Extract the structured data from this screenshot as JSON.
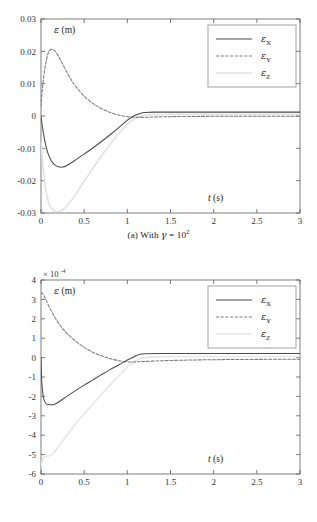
{
  "figure": {
    "panels": [
      {
        "id": "a",
        "caption_prefix": "(a) With ",
        "caption_symbol": "γ",
        "caption_equals": " = 10",
        "caption_exponent": "2"
      },
      {
        "id": "b",
        "caption_prefix": "(b) With ",
        "caption_symbol": "γ",
        "caption_equals": " = 10",
        "caption_exponent": "4"
      }
    ]
  },
  "chart_data": [
    {
      "type": "line",
      "title": "",
      "panel_label": "(a) With γ = 10^2",
      "ylabel": "ε (m)",
      "xlabel": "t (s)",
      "exponent_label": "",
      "xlim": [
        0,
        3
      ],
      "ylim": [
        -0.03,
        0.03
      ],
      "xticks": [
        0,
        0.5,
        1,
        1.5,
        2,
        2.5,
        3
      ],
      "xticklabels": [
        "0",
        "0.5",
        "1",
        "1.5",
        "2",
        "2.5",
        "3"
      ],
      "yticks": [
        0.03,
        0.02,
        0.01,
        0,
        -0.01,
        -0.02,
        -0.03
      ],
      "yticklabels": [
        "0.03",
        "0.02",
        "0.01",
        "0",
        "-0.01",
        "-0.02",
        "-0.03"
      ],
      "grid": false,
      "legend_position": "upper right",
      "legend": [
        "ε",
        "ε",
        "ε"
      ],
      "legend_subscripts": [
        "X",
        "Y",
        "Z"
      ],
      "series": [
        {
          "name": "epsilon_X",
          "style": "solid",
          "color": "#4a4a4a",
          "x": [
            0,
            0.02,
            0.05,
            0.08,
            0.12,
            0.16,
            0.2,
            0.25,
            0.3,
            0.35,
            0.4,
            0.5,
            0.6,
            0.7,
            0.8,
            0.9,
            1.0,
            1.05,
            1.1,
            1.15,
            1.2,
            1.3,
            1.5,
            2.0,
            2.5,
            3.0
          ],
          "y": [
            0,
            -0.004,
            -0.0085,
            -0.0115,
            -0.0139,
            -0.0151,
            -0.0157,
            -0.0158,
            -0.0153,
            -0.0145,
            -0.0136,
            -0.0118,
            -0.0099,
            -0.0079,
            -0.0058,
            -0.0036,
            -0.0013,
            -0.0004,
            0.0003,
            0.0008,
            0.0011,
            0.0012,
            0.0012,
            0.0012,
            0.0012,
            0.0012
          ]
        },
        {
          "name": "epsilon_Y",
          "style": "dashed",
          "color": "#7a7a7a",
          "x": [
            0,
            0.02,
            0.05,
            0.08,
            0.1,
            0.13,
            0.16,
            0.2,
            0.25,
            0.3,
            0.35,
            0.4,
            0.5,
            0.6,
            0.7,
            0.8,
            0.9,
            1.0,
            1.1,
            1.2,
            1.3,
            1.5,
            2.0,
            2.5,
            3.0
          ],
          "y": [
            0.003,
            0.0095,
            0.0155,
            0.0192,
            0.0203,
            0.0206,
            0.0201,
            0.0186,
            0.0161,
            0.0135,
            0.0112,
            0.0092,
            0.0061,
            0.0039,
            0.0023,
            0.0011,
            0.0003,
            -0.0002,
            -0.0004,
            -0.0004,
            -0.0003,
            -0.0002,
            -0.0001,
            -0.0001,
            -0.0001
          ]
        },
        {
          "name": "epsilon_Z",
          "style": "solid-light",
          "color": "#e2e2e2",
          "x": [
            0,
            0.03,
            0.06,
            0.1,
            0.14,
            0.18,
            0.22,
            0.25,
            0.28,
            0.32,
            0.36,
            0.4,
            0.5,
            0.6,
            0.7,
            0.8,
            0.9,
            1.0,
            1.05,
            1.1,
            1.2,
            1.3,
            1.5,
            2.0,
            2.5,
            3.0
          ],
          "y": [
            -0.008,
            -0.0175,
            -0.0235,
            -0.0276,
            -0.0291,
            -0.0296,
            -0.0294,
            -0.029,
            -0.0284,
            -0.0272,
            -0.0258,
            -0.0243,
            -0.0202,
            -0.0162,
            -0.0124,
            -0.0088,
            -0.0055,
            -0.0025,
            -0.0014,
            -0.0006,
            0.0002,
            0.0004,
            0.0005,
            0.0005,
            0.0005,
            0.0005
          ]
        }
      ]
    },
    {
      "type": "line",
      "title": "",
      "panel_label": "(b) With γ = 10^4",
      "ylabel": "ε (m)",
      "xlabel": "t (s)",
      "exponent_label": "× 10⁻⁴",
      "exponent_base": "10",
      "exponent_power": "-4",
      "xlim": [
        0,
        3
      ],
      "ylim": [
        -6,
        4
      ],
      "yscale_factor": 0.0001,
      "xticks": [
        0,
        0.5,
        1,
        1.5,
        2,
        2.5,
        3
      ],
      "xticklabels": [
        "0",
        "0.5",
        "1",
        "1.5",
        "2",
        "2.5",
        "3"
      ],
      "yticks": [
        4,
        3,
        2,
        1,
        0,
        -1,
        -2,
        -3,
        -4,
        -5,
        -6
      ],
      "yticklabels": [
        "4",
        "3",
        "2",
        "1",
        "0",
        "-1",
        "-2",
        "-3",
        "-4",
        "-5",
        "-6"
      ],
      "grid": false,
      "legend_position": "upper right",
      "legend": [
        "ε",
        "ε",
        "ε"
      ],
      "legend_subscripts": [
        "X",
        "Y",
        "Z"
      ],
      "series": [
        {
          "name": "epsilon_X",
          "style": "solid",
          "color": "#4a4a4a",
          "x": [
            0,
            0.01,
            0.03,
            0.06,
            0.09,
            0.12,
            0.15,
            0.2,
            0.3,
            0.4,
            0.5,
            0.6,
            0.7,
            0.8,
            0.9,
            1.0,
            1.05,
            1.1,
            1.15,
            1.2,
            1.4,
            1.8,
            2.2,
            2.6,
            3.0
          ],
          "y": [
            0,
            -1.3,
            -2.1,
            -2.38,
            -2.42,
            -2.43,
            -2.42,
            -2.3,
            -2.0,
            -1.7,
            -1.42,
            -1.15,
            -0.88,
            -0.62,
            -0.38,
            -0.12,
            -0.02,
            0.1,
            0.17,
            0.2,
            0.21,
            0.21,
            0.21,
            0.21,
            0.21
          ]
        },
        {
          "name": "epsilon_Y",
          "style": "dashed",
          "color": "#7a7a7a",
          "x": [
            0,
            0.02,
            0.05,
            0.08,
            0.12,
            0.16,
            0.2,
            0.25,
            0.3,
            0.4,
            0.5,
            0.6,
            0.7,
            0.8,
            0.9,
            1.0,
            1.1,
            1.2,
            1.4,
            1.8,
            2.2,
            2.6,
            3.0
          ],
          "y": [
            3.35,
            3.3,
            3.05,
            2.75,
            2.4,
            2.08,
            1.8,
            1.5,
            1.25,
            0.85,
            0.53,
            0.28,
            0.09,
            -0.05,
            -0.16,
            -0.22,
            -0.22,
            -0.2,
            -0.16,
            -0.12,
            -0.1,
            -0.09,
            -0.08
          ]
        },
        {
          "name": "epsilon_Z",
          "style": "solid-light",
          "color": "#e6e6e6",
          "x": [
            0,
            0.02,
            0.04,
            0.06,
            0.09,
            0.12,
            0.15,
            0.2,
            0.25,
            0.3,
            0.4,
            0.5,
            0.6,
            0.7,
            0.8,
            0.9,
            1.0,
            1.05,
            1.1,
            1.2,
            1.4,
            1.8,
            2.2,
            2.6,
            3.0
          ],
          "y": [
            -5.6,
            -5.25,
            -5.1,
            -5.08,
            -5.07,
            -5.0,
            -4.9,
            -4.6,
            -4.3,
            -4.0,
            -3.42,
            -2.9,
            -2.4,
            -1.9,
            -1.42,
            -0.95,
            -0.48,
            -0.3,
            -0.15,
            0.0,
            0.05,
            0.06,
            0.06,
            0.06,
            0.06
          ]
        }
      ]
    }
  ]
}
